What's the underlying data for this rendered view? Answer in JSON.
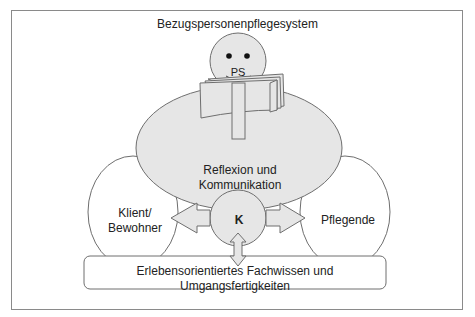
{
  "diagram": {
    "title": "Bezugspersonenpflegesystem",
    "head_label": "PS",
    "center_label_line1": "Reflexion und",
    "center_label_line2": "Kommunikation",
    "left_label_line1": "Klient/",
    "left_label_line2": "Bewohner",
    "right_label": "Pflegende",
    "hub_label": "K",
    "bottom_box_label": "Erlebensorientiertes Fachwissen und Umgangsfertigkeiten",
    "colors": {
      "fill_gray": "#e6e6e6",
      "stroke": "#6e6e6e",
      "frame": "#8a8a8a",
      "white": "#ffffff"
    }
  }
}
